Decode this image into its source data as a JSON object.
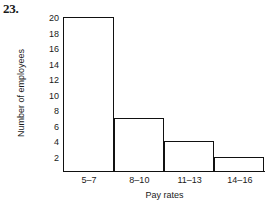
{
  "problem_number": "23.",
  "chart_data": {
    "type": "bar",
    "title": "",
    "subtitle": "",
    "xlabel": "Pay rates",
    "ylabel": "Number of employees",
    "categories": [
      "5–7",
      "8–10",
      "11–13",
      "14–16"
    ],
    "values": [
      20,
      7,
      4,
      2
    ],
    "ylim": [
      0,
      20
    ],
    "yticks": [
      2,
      4,
      6,
      8,
      10,
      12,
      14,
      16,
      18,
      20
    ],
    "ytick_labels": [
      "2",
      "4",
      "6",
      "8",
      "10",
      "12",
      "14",
      "16",
      "18",
      "20"
    ],
    "grid": false,
    "legend": null,
    "bar_style": {
      "fill": "#ffffff",
      "edge": "#111111",
      "gap": 0
    },
    "annotations": []
  }
}
